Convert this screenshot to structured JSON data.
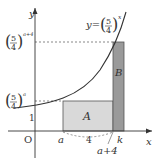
{
  "diagram": {
    "curve_label": "y=(5/4)^x",
    "curve_base_num": "5",
    "curve_base_den": "4",
    "curve_exp": "x",
    "y_axis_label": "y",
    "x_axis_label": "x",
    "origin_label": "O",
    "y_tick_1": "1",
    "y_tick_top_num": "5",
    "y_tick_top_den": "4",
    "y_tick_top_exp": "a+4",
    "y_tick_mid_num": "5",
    "y_tick_mid_den": "4",
    "y_tick_mid_exp": "a",
    "x_label_a": "a",
    "x_label_k": "k",
    "x_label_a4": "a+4",
    "width_label": "4",
    "region_a": "A",
    "region_b": "B",
    "colors": {
      "region_a": "#d9d9d9",
      "region_b": "#9a9a9a",
      "line": "#333333"
    }
  }
}
